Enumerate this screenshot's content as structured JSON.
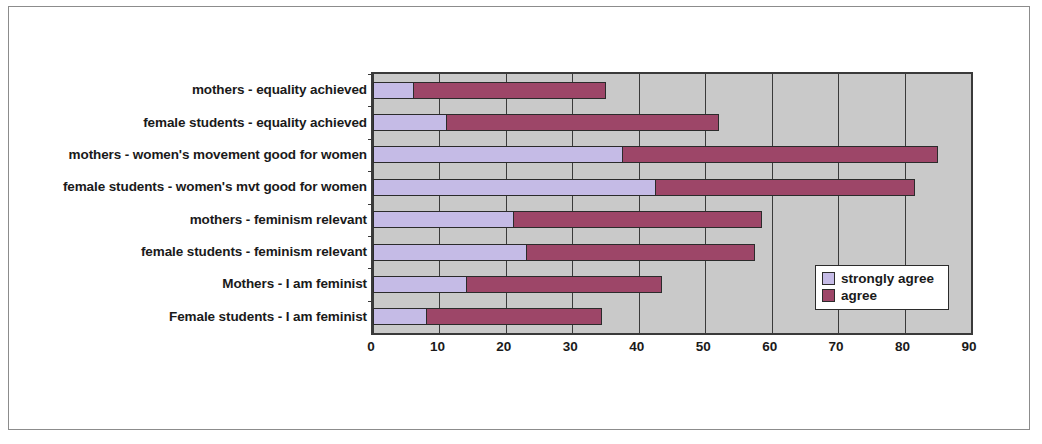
{
  "chart_data": {
    "type": "bar",
    "orientation": "horizontal",
    "stacked": true,
    "title": "",
    "xlabel": "",
    "ylabel": "",
    "xlim": [
      0,
      90
    ],
    "xticks": [
      "0",
      "10",
      "20",
      "30",
      "40",
      "50",
      "60",
      "70",
      "80",
      "90"
    ],
    "grid": true,
    "legend_position": "inside-right",
    "plot_background": "#c9c9c9",
    "categories": [
      "mothers - equality achieved",
      "female students - equality achieved",
      "mothers - women's movement good for women",
      "female students - women's mvt good for women",
      "mothers - feminism relevant",
      "female students - feminism relevant",
      "Mothers - I am feminist",
      "Female students - I am feminist"
    ],
    "series": [
      {
        "name": "strongly agree",
        "color": "#c5bbe6",
        "values": [
          6,
          11,
          37.5,
          42.5,
          21,
          23,
          14,
          8
        ]
      },
      {
        "name": "agree",
        "color": "#9d4668",
        "values": [
          29,
          41,
          47.5,
          39,
          37.5,
          34.5,
          29.5,
          26.5
        ]
      }
    ],
    "totals": [
      35,
      52,
      85,
      81.5,
      58.5,
      57.5,
      43.5,
      34.5
    ]
  },
  "legend": {
    "items": [
      {
        "label": "strongly agree",
        "color": "#c5bbe6"
      },
      {
        "label": "agree",
        "color": "#9d4668"
      }
    ]
  }
}
